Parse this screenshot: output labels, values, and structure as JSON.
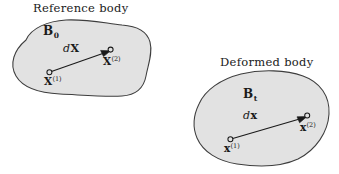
{
  "figure": {
    "width": 339,
    "height": 174,
    "background": "#ffffff",
    "blob_fill": "#e2e2e2",
    "blob_stroke": "#3d3d3d",
    "ink": "#1a1a1a"
  },
  "reference": {
    "title": "Reference body",
    "body_label": "B",
    "body_subscript": "0",
    "vector_label": "d",
    "vector_symbol": "X",
    "tail_label": "X",
    "tail_superscript": "(1)",
    "head_label": "X",
    "head_superscript": "(2)"
  },
  "deformed": {
    "title": "Deformed body",
    "body_label": "B",
    "body_subscript": "t",
    "vector_label": "d",
    "vector_symbol": "x",
    "tail_label": "x",
    "tail_superscript": "(1)",
    "head_label": "x",
    "head_superscript": "(2)"
  }
}
